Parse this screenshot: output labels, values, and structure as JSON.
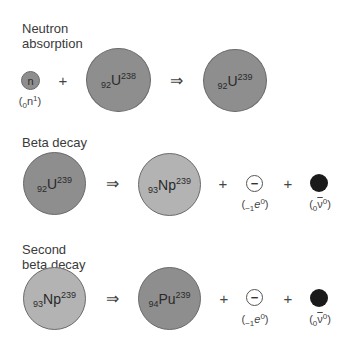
{
  "colors": {
    "dark_nucleus": "#8e8e8e",
    "light_nucleus": "#b3b3b3",
    "electron_fill": "#ffffff",
    "antineutrino_fill": "#1a1a1a"
  },
  "sections": [
    {
      "title_line1": "Neutron",
      "title_line2": "absorption",
      "neutron": {
        "symbol": "n",
        "label_open": "(",
        "label_sub": "0",
        "label_main": "n",
        "label_sup": "1",
        "label_close": ")"
      },
      "plus": "+",
      "reactant": {
        "sub": "92",
        "el": "U",
        "sup": "238"
      },
      "arrow": "⇒",
      "product": {
        "sub": "92",
        "el": "U",
        "sup": "239"
      }
    },
    {
      "title_line1": "Beta decay",
      "reactant": {
        "sub": "92",
        "el": "U",
        "sup": "239"
      },
      "arrow": "⇒",
      "product": {
        "sub": "93",
        "el": "Np",
        "sup": "239"
      },
      "plus1": "+",
      "electron": {
        "symbol": "−",
        "label_open": "(",
        "label_sub": "−1",
        "label_main": "e",
        "label_sup": "0",
        "label_close": ")"
      },
      "plus2": "+",
      "antineutrino": {
        "label_open": "(",
        "label_sub": "0",
        "label_main": "ν",
        "label_sup": "0",
        "label_close": ")"
      }
    },
    {
      "title_line1": "Second",
      "title_line2": "beta decay",
      "reactant": {
        "sub": "93",
        "el": "Np",
        "sup": "239"
      },
      "arrow": "⇒",
      "product": {
        "sub": "94",
        "el": "Pu",
        "sup": "239"
      },
      "plus1": "+",
      "electron": {
        "symbol": "−",
        "label_open": "(",
        "label_sub": "−1",
        "label_main": "e",
        "label_sup": "0",
        "label_close": ")"
      },
      "plus2": "+",
      "antineutrino": {
        "label_open": "(",
        "label_sub": "0",
        "label_main": "ν",
        "label_sup": "0",
        "label_close": ")"
      }
    }
  ]
}
